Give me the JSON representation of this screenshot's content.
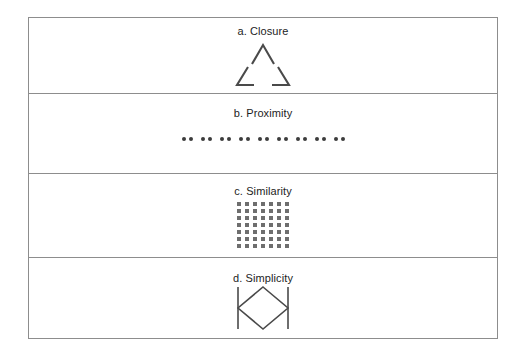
{
  "figure": {
    "panels": [
      {
        "id": "closure",
        "label": "a. Closure",
        "stimulus": "illusory-triangle",
        "description": "Three corner wedges forming an implied triangle with gaps at the midpoint of each side"
      },
      {
        "id": "proximity",
        "label": "b. Proximity",
        "stimulus": "paired-dots",
        "pair_count": 9,
        "dots_per_pair": 2,
        "total_dots": 18
      },
      {
        "id": "similarity",
        "label": "c. Similarity",
        "stimulus": "square-grid",
        "rows": 7,
        "columns": 7,
        "total_squares": 49
      },
      {
        "id": "simplicity",
        "label": "d. Simplicity",
        "stimulus": "diamond-between-bars",
        "description": "A diamond whose left and right vertices meet two vertical line segments"
      }
    ]
  },
  "colors": {
    "frame_border": "#8d8d8d",
    "panel_divider": "#8d8d8d",
    "stroke": "#4a4a4a",
    "dot_fill": "#3c3c3c",
    "square_fill": "#6e6e6e",
    "text": "#1d1d1d",
    "background": "#ffffff"
  }
}
